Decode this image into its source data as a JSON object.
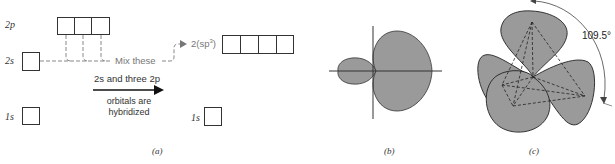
{
  "panel_a": {
    "levels": {
      "two_p": "2p",
      "two_s": "2s",
      "one_s_left": "1s",
      "one_s_right": "1s"
    },
    "mix_label": "Mix these",
    "hybrid_label_prefix": "2(sp",
    "hybrid_label_sup": "3",
    "hybrid_label_suffix": ")",
    "arrow_text_top": "2s and three 2p",
    "arrow_text_bottom_1": "orbitals are",
    "arrow_text_bottom_2": "hybridized",
    "caption": "(a)"
  },
  "panel_b": {
    "caption": "(b)"
  },
  "panel_c": {
    "angle_label": "109.5°",
    "caption": "(c)"
  },
  "colors": {
    "lobe_fill": "#9a9a9a",
    "outline": "#333333",
    "dashed_gray": "#888888"
  }
}
